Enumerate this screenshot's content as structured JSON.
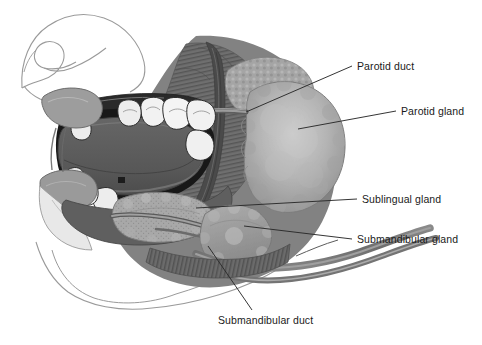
{
  "figure": {
    "type": "anatomical-illustration",
    "background_color": "#ffffff",
    "line_color": "#1a1a1a",
    "outline_color": "#8c8c8c"
  },
  "labels": [
    {
      "id": "parotid-duct",
      "text": "Parotid duct"
    },
    {
      "id": "parotid-gland",
      "text": "Parotid gland"
    },
    {
      "id": "sublingual-gland",
      "text": "Sublingual gland"
    },
    {
      "id": "submandibular-gland",
      "text": "Submandibular gland"
    },
    {
      "id": "submandibular-duct",
      "text": "Submandibular duct"
    }
  ],
  "structures": {
    "parotid_gland": {
      "name": "Parotid gland",
      "fill": "#b0b0b0",
      "edge": "#8f8f8f"
    },
    "parotid_duct": {
      "name": "Parotid duct",
      "fill": "#7a7a7a"
    },
    "submandibular_gland": {
      "name": "Submandibular gland",
      "fill": "#9a9a9a"
    },
    "sublingual_gland": {
      "name": "Sublingual gland",
      "fill": "#a8a8a8"
    },
    "submandibular_duct": {
      "name": "Submandibular duct",
      "fill": "#8a8a8a"
    },
    "tongue": {
      "name": "Tongue",
      "fill": "#5b5b5b"
    },
    "oral_cavity": {
      "name": "Oral cavity",
      "fill": "#1c1c1c"
    },
    "teeth": {
      "name": "Teeth",
      "fill": "#f2f2f2"
    },
    "masseter_muscle": {
      "name": "Masseter muscle",
      "fill": "#707070"
    },
    "mandible": {
      "name": "Mandible",
      "fill": "#6a6a6a"
    },
    "lips": {
      "name": "Lips",
      "fill": "#9d9d9d"
    },
    "face_outline": {
      "name": "Facial profile outline",
      "fill": "none"
    }
  }
}
